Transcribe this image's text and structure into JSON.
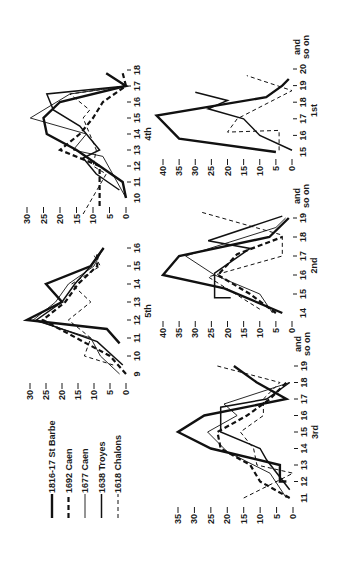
{
  "chart_data": {
    "type": "line",
    "orientation": "rotated 90 degrees counter-clockwise",
    "legend": {
      "placement": "top-left",
      "entries": [
        {
          "name": "1816-17 St Barbe",
          "style": "thick-solid"
        },
        {
          "name": "1692 Caen",
          "style": "thick-dashed"
        },
        {
          "name": "1677 Caen",
          "style": "thin-solid"
        },
        {
          "name": "1638 Troyes",
          "style": "medium-solid"
        },
        {
          "name": "1618 Chalons",
          "style": "thin-dashed"
        }
      ]
    },
    "panels": [
      {
        "id": "1st",
        "title": "1st",
        "x_ticks": [
          "15",
          "16",
          "17",
          "18",
          "19",
          "20"
        ],
        "x_end_label": [
          "and",
          "so on"
        ],
        "y_ticks": [
          0,
          5,
          10,
          15,
          20,
          25,
          30,
          35,
          40
        ],
        "ylim": [
          0,
          40
        ],
        "series": [
          {
            "name": "1816-17 St Barbe",
            "x": [
              15,
              15.8,
              17.2,
              18.3,
              19,
              19.4
            ],
            "y": [
              5,
              35,
              42,
              8,
              3,
              1
            ]
          },
          {
            "name": "1638 Troyes",
            "x": [
              15.1,
              16,
              17,
              17.6,
              18.1,
              18.6
            ],
            "y": [
              0,
              10,
              15,
              26,
              20,
              30
            ]
          },
          {
            "name": "1618 Chalons",
            "x": [
              15.1,
              16.3,
              16.2,
              17,
              18.7,
              19.6
            ],
            "y": [
              4,
              4,
              20,
              17,
              0,
              14
            ]
          }
        ]
      },
      {
        "id": "2nd",
        "title": "2nd",
        "x_ticks": [
          "14",
          "15",
          "16",
          "17",
          "18",
          "19"
        ],
        "x_end_label": [
          "and",
          "so on"
        ],
        "y_ticks": [
          0,
          5,
          10,
          15,
          20,
          25,
          30,
          35,
          40
        ],
        "ylim": [
          0,
          40
        ],
        "series": [
          {
            "name": "1816-17 St Barbe",
            "x": [
              14,
              15.3,
              16,
              17,
              18,
              19
            ],
            "y": [
              3,
              21,
              40,
              35,
              7,
              1
            ]
          },
          {
            "name": "1692 Caen",
            "x": [
              14,
              15,
              16,
              17.1,
              18
            ],
            "y": [
              5,
              13,
              23,
              17,
              3
            ]
          },
          {
            "name": "1677 Caen",
            "x": [
              14,
              15,
              16,
              17,
              18.5,
              19
            ],
            "y": [
              6,
              10,
              24,
              33,
              5,
              2
            ]
          },
          {
            "name": "1638 Troyes",
            "x": [
              14.8,
              14.8,
              16.1,
              17.4,
              17.8,
              19.1
            ],
            "y": [
              19,
              24,
              24,
              13,
              26,
              3
            ]
          },
          {
            "name": "1618 Chalons",
            "x": [
              14.2,
              15.9,
              17,
              17.7,
              18.1,
              19.3
            ],
            "y": [
              10,
              26,
              3,
              3,
              3,
              28
            ]
          }
        ]
      },
      {
        "id": "3rd",
        "title": "3rd",
        "x_ticks": [
          "11",
          "12",
          "13",
          "14",
          "15",
          "16",
          "17",
          "18",
          "19"
        ],
        "x_end_label": [
          "and",
          "so on"
        ],
        "y_ticks": [
          0,
          5,
          10,
          15,
          20,
          25,
          30,
          35
        ],
        "ylim": [
          0,
          35
        ],
        "series": [
          {
            "name": "1816-17 St Barbe",
            "x": [
              12,
              12,
              13,
              14,
              15,
              16,
              17,
              18,
              19
            ],
            "y": [
              2,
              4,
              4,
              25,
              35,
              27,
              2,
              11,
              18
            ]
          },
          {
            "name": "1692 Caen",
            "x": [
              11,
              12,
              13,
              14,
              15,
              16,
              17,
              18
            ],
            "y": [
              1,
              10,
              13,
              22,
              23,
              14,
              7,
              2
            ]
          },
          {
            "name": "1677 Caen",
            "x": [
              11,
              12.5,
              13.8,
              15,
              16,
              16.7,
              18
            ],
            "y": [
              2,
              7,
              20,
              26,
              17,
              21,
              1
            ]
          },
          {
            "name": "1638 Troyes",
            "x": [
              11.5,
              13.3,
              14,
              15,
              16.5,
              17,
              18
            ],
            "y": [
              1,
              8,
              10,
              22,
              22,
              8,
              1
            ]
          },
          {
            "name": "1618 Chalons",
            "x": [
              11,
              12.5,
              13,
              14,
              15,
              16,
              17,
              18,
              19
            ],
            "y": [
              15,
              0,
              11,
              12,
              16,
              9,
              9,
              4,
              23
            ]
          }
        ]
      },
      {
        "id": "4th",
        "title": "4th",
        "x_ticks": [
          "10",
          "11",
          "12",
          "13",
          "14",
          "15",
          "16",
          "17",
          "18"
        ],
        "y_ticks": [
          0,
          5,
          10,
          15,
          20,
          25,
          30
        ],
        "ylim": [
          0,
          30
        ],
        "series": [
          {
            "name": "1816-17 St Barbe",
            "x": [
              10,
              11,
              12,
              13,
              14,
              15,
              16,
              17,
              17.8
            ],
            "y": [
              0,
              1,
              8,
              15,
              24,
              25,
              20,
              0,
              6
            ]
          },
          {
            "name": "1692 Caen",
            "x": [
              9.5,
              12,
              13,
              14,
              15,
              16,
              17,
              17.8
            ],
            "y": [
              8,
              8,
              20,
              14,
              10,
              7,
              0,
              1
            ]
          },
          {
            "name": "1677 Caen",
            "x": [
              10,
              12.6,
              13,
              14,
              15,
              16.5,
              17
            ],
            "y": [
              0,
              7,
              16,
              12,
              29,
              17,
              0
            ]
          },
          {
            "name": "1638 Troyes",
            "x": [
              10.5,
              11.5,
              12.5,
              13,
              14.5,
              15.5,
              16.5,
              17
            ],
            "y": [
              2,
              9,
              13,
              8,
              14,
              22,
              24,
              0
            ]
          },
          {
            "name": "1618 Chalons",
            "x": [
              9,
              11.5,
              12,
              13,
              15,
              15.5,
              16.5,
              17
            ],
            "y": [
              13,
              6,
              10,
              9,
              13,
              11,
              17,
              0
            ]
          }
        ]
      },
      {
        "id": "5th",
        "title": "5th",
        "x_ticks": [
          "9",
          "10",
          "11",
          "12",
          "13",
          "14",
          "15",
          "16"
        ],
        "y_ticks": [
          0,
          5,
          10,
          15,
          20,
          25,
          30
        ],
        "ylim": [
          0,
          30
        ],
        "series": [
          {
            "name": "1816-17 St Barbe",
            "x": [
              10.7,
              11.5,
              12,
              13,
              14,
              15,
              16
            ],
            "y": [
              2,
              6,
              31,
              20,
              25,
              11,
              7
            ]
          },
          {
            "name": "1692 Caen",
            "x": [
              9,
              10,
              12,
              13,
              14,
              15,
              15.8
            ],
            "y": [
              0,
              5,
              26,
              19,
              15,
              9,
              9
            ]
          },
          {
            "name": "1677 Caen",
            "x": [
              9,
              10,
              11,
              12,
              13,
              14,
              15,
              15.7
            ],
            "y": [
              2,
              8,
              11,
              29,
              22,
              18,
              10,
              8
            ]
          },
          {
            "name": "1638 Troyes",
            "x": [
              9.5,
              10.8,
              12,
              13,
              14,
              15,
              16
            ],
            "y": [
              1,
              9,
              28,
              20,
              16,
              11,
              7
            ]
          },
          {
            "name": "1618 Chalons",
            "x": [
              9.5,
              10,
              11,
              12,
              13,
              14,
              15,
              15.6
            ],
            "y": [
              4,
              13,
              11,
              18,
              11,
              17,
              8,
              10
            ]
          }
        ]
      }
    ]
  }
}
